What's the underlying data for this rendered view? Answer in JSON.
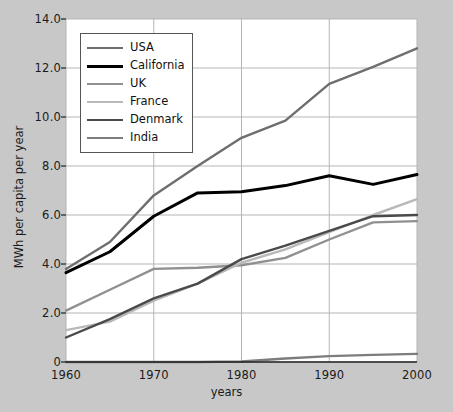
{
  "figure": {
    "background_color": "#c8c8c8",
    "plot_background_color": "#ffffff",
    "grid_color": "#b5b5b5",
    "axis_color": "#222222"
  },
  "axis": {
    "xlabel": "years",
    "ylabel": "MWh per capita per year",
    "yticks": [
      "0",
      "2.0",
      "4.0",
      "6.0",
      "8.0",
      "10.0",
      "12.0",
      "14.0"
    ],
    "xticks": [
      "1960",
      "1970",
      "1980",
      "1990",
      "2000"
    ]
  },
  "legend": {
    "entries": [
      {
        "label": "USA",
        "color": "#6e6e6e",
        "width": 2.4
      },
      {
        "label": "California",
        "color": "#000000",
        "width": 3.0
      },
      {
        "label": "UK",
        "color": "#909090",
        "width": 2.4
      },
      {
        "label": "France",
        "color": "#b9b9b9",
        "width": 2.4
      },
      {
        "label": "Denmark",
        "color": "#4a4a4a",
        "width": 2.4
      },
      {
        "label": "India",
        "color": "#7d7d7d",
        "width": 2.4
      }
    ]
  },
  "chart_data": {
    "type": "line",
    "title": "",
    "xlabel": "years",
    "ylabel": "MWh per capita per year",
    "xlim": [
      1960,
      2000
    ],
    "ylim": [
      0,
      14
    ],
    "xticks": [
      1960,
      1970,
      1980,
      1990,
      2000
    ],
    "yticks": [
      0,
      2,
      4,
      6,
      8,
      10,
      12,
      14
    ],
    "grid": true,
    "legend_position": "upper left",
    "x": [
      1960,
      1965,
      1970,
      1975,
      1980,
      1985,
      1990,
      1995,
      2000
    ],
    "series": [
      {
        "name": "USA",
        "color": "#6e6e6e",
        "values": [
          3.8,
          4.9,
          6.8,
          8.0,
          9.15,
          9.85,
          11.35,
          12.05,
          12.8
        ]
      },
      {
        "name": "California",
        "color": "#000000",
        "values": [
          3.65,
          4.5,
          5.95,
          6.9,
          6.95,
          7.2,
          7.6,
          7.25,
          7.65
        ]
      },
      {
        "name": "UK",
        "color": "#909090",
        "values": [
          2.1,
          2.95,
          3.8,
          3.85,
          3.95,
          4.25,
          5.0,
          5.7,
          5.75
        ]
      },
      {
        "name": "France",
        "color": "#b9b9b9",
        "values": [
          1.3,
          1.65,
          2.5,
          3.2,
          4.05,
          4.6,
          5.3,
          6.0,
          6.65
        ]
      },
      {
        "name": "Denmark",
        "color": "#4a4a4a",
        "values": [
          1.0,
          1.75,
          2.6,
          3.2,
          4.2,
          4.75,
          5.35,
          5.95,
          6.0
        ]
      },
      {
        "name": "India",
        "color": "#7d7d7d",
        "values": [
          0.0,
          0.0,
          0.0,
          0.0,
          0.02,
          0.14,
          0.24,
          0.29,
          0.33
        ]
      }
    ]
  }
}
